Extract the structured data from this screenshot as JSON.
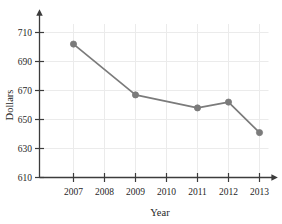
{
  "chart_data": {
    "type": "line",
    "title": "",
    "xlabel": "Year",
    "ylabel": "Dollars",
    "categories": [
      "2007",
      "2008",
      "2009",
      "2010",
      "2011",
      "2012",
      "2013"
    ],
    "x": [
      2007,
      2008,
      2009,
      2010,
      2011,
      2012,
      2013
    ],
    "series": [
      {
        "name": "Dollars",
        "points": [
          {
            "x": "2007",
            "y": 702
          },
          {
            "x": "2009",
            "y": 667
          },
          {
            "x": "2011",
            "y": 658
          },
          {
            "x": "2012",
            "y": 662
          },
          {
            "x": "2013",
            "y": 641
          }
        ]
      }
    ],
    "ylim": [
      610,
      716
    ],
    "xlim": [
      2006.4,
      2013.6
    ],
    "yticks": [
      610,
      630,
      650,
      670,
      690,
      710
    ],
    "ytick_labels": [
      "610",
      "630",
      "650",
      "670",
      "690",
      "710"
    ],
    "xticks": [
      2007,
      2008,
      2009,
      2010,
      2011,
      2012,
      2013
    ],
    "xtick_labels": [
      "2007",
      "2008",
      "2009",
      "2010",
      "2011",
      "2012",
      "2013"
    ],
    "grid": true,
    "grid_axes": "both",
    "legend": false,
    "legend_position": "none",
    "marker": "circle",
    "markers_at": [
      "2007",
      "2009",
      "2011",
      "2012",
      "2013"
    ],
    "axis_arrows": {
      "x": "right",
      "y": "up"
    }
  },
  "colors": {
    "line": "#7b7b7b",
    "marker": "#7b7b7b",
    "grid": "#ebebeb",
    "axis": "#3c3c3c",
    "text": "#1f1f1f",
    "background": "#ffffff"
  },
  "axes": {
    "y_title": "Dollars",
    "x_title": "Year"
  }
}
